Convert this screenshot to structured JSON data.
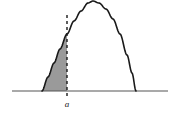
{
  "figure": {
    "title": "",
    "background_color": "#ffffff",
    "curve_color": "#1a1a1a",
    "axis_color": "#555555",
    "shade_color": "#9a9a9a",
    "shade_edge_color": "#6e6e6e",
    "dashed_color": "#1a1a1a",
    "axis": {
      "name": "horizontal-axis",
      "y": 91,
      "x_start": 12,
      "x_end": 168,
      "stroke_width": 1.2
    },
    "curve": {
      "name": "probability-density-curve",
      "shape": "bell",
      "left_base_x": 42,
      "right_base_x": 136,
      "peak_x": 93,
      "peak_y": 11,
      "stroke_width": 1.6
    },
    "marker": {
      "name": "vertical-dashed-line",
      "x": 67,
      "y_top": 15,
      "y_bottom": 91,
      "dash_pattern": "3,3",
      "stroke_width": 1.4,
      "tick_below_axis": {
        "y_top": 93,
        "y_bottom": 99
      }
    },
    "shaded_region": {
      "name": "shaded-area-under-curve",
      "from_x": 42,
      "to_x": 67,
      "description": "area under curve left of a"
    },
    "labels": {
      "point_a": "a",
      "point_a_x": 67,
      "point_a_y": 107
    }
  },
  "chart_data": {
    "type": "area",
    "title": "",
    "xlabel": "",
    "ylabel": "",
    "grid": false,
    "legend": null,
    "xlim": [
      12,
      168
    ],
    "ylim": [
      0,
      91
    ],
    "annotations": [
      {
        "text": "a",
        "x": 67,
        "y": 0,
        "style": "italic"
      }
    ],
    "series": [
      {
        "name": "density-curve",
        "x": [
          42,
          48,
          54,
          60,
          67,
          74,
          81,
          88,
          93,
          99,
          106,
          113,
          120,
          127,
          132,
          136
        ],
        "y": [
          0,
          14,
          28,
          42,
          57,
          70,
          80,
          88,
          90,
          88,
          82,
          72,
          57,
          36,
          18,
          0
        ]
      }
    ],
    "shaded": {
      "name": "area-a",
      "x_from": 42,
      "x_to": 67,
      "color": "#9a9a9a"
    }
  }
}
